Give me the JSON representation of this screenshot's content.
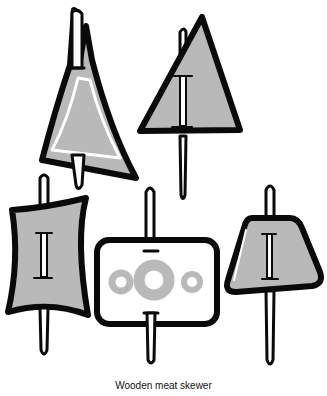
{
  "caption": "Wooden meat skewer",
  "colors": {
    "ink": "#0a0a0a",
    "fill": "#b9b9b9",
    "paper": "#ffffff"
  },
  "figures": [
    {
      "name": "tall-sail-skewer",
      "shape": "curved triangle with inner light outline"
    },
    {
      "name": "triangle-skewer",
      "shape": "triangle with I mark"
    },
    {
      "name": "concave-rectangle-skewer",
      "shape": "concave-sided rectangle with I mark"
    },
    {
      "name": "rounded-rectangle-skewer",
      "shape": "rounded rectangle with three ring cutouts"
    },
    {
      "name": "trapezoid-skewer",
      "shape": "rounded trapezoid with I mark"
    }
  ]
}
